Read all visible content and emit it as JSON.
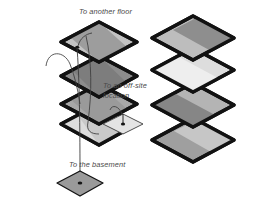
{
  "figure": {
    "type": "diagram",
    "background_color": "#ffffff",
    "outline_color": "#121212",
    "label_color": "#4a4a4a"
  },
  "labels": {
    "to_another_floor": "To another floor",
    "to_offsite_line1": "To an off-site",
    "to_offsite_line2": "location",
    "to_the_basement": "To the basement"
  },
  "left_stack": {
    "name": "left-floor-stack",
    "floor_count": 4,
    "floors": [
      {
        "id": "floor-1",
        "position": "top",
        "fill": "#c3c3c3",
        "band_fill": "#9d9d9d"
      },
      {
        "id": "floor-2",
        "position": "upper",
        "fill": "#8c8c8c",
        "band_fill": "#7d7d7d"
      },
      {
        "id": "floor-3",
        "position": "lower",
        "fill": "#a8a8a8",
        "band_fill": "#9a9a9a"
      },
      {
        "id": "floor-4",
        "position": "bottom",
        "fill": "#dcdcdc",
        "band_fill": "#c9c9c9"
      }
    ],
    "nodes": [
      {
        "id": "riser-top-node",
        "shape": "dot",
        "on_floor": "floor-1"
      },
      {
        "id": "basement-slab",
        "shape": "diamond",
        "fill": "#9a9a9a"
      },
      {
        "id": "offsite-slab",
        "shape": "diamond",
        "fill": "#e4e4e4"
      }
    ],
    "connectors": [
      {
        "id": "connector-another-floor",
        "from": "floor-1",
        "to": "label-to-another-floor"
      },
      {
        "id": "connector-offsite",
        "from": "floor-4",
        "to": "offsite-slab"
      },
      {
        "id": "connector-basement",
        "from": "floor-1",
        "to": "basement-slab"
      },
      {
        "id": "connector-riser-curve",
        "from": "floor-2",
        "to": "floor-4"
      }
    ]
  },
  "right_stack": {
    "name": "right-floor-stack",
    "floor_count": 4,
    "floors": [
      {
        "id": "r-floor-1",
        "position": "top",
        "fill": "#bdbdbd",
        "band_fill": "#8e8e8e"
      },
      {
        "id": "r-floor-2",
        "position": "upper",
        "fill": "#dddddd",
        "band_fill": "#eeeeee"
      },
      {
        "id": "r-floor-3",
        "position": "lower",
        "fill": "#b4b4b4",
        "band_fill": "#868686"
      },
      {
        "id": "r-floor-4",
        "position": "bottom",
        "fill": "#9f9f9f",
        "band_fill": "#c6c6c6"
      }
    ]
  }
}
